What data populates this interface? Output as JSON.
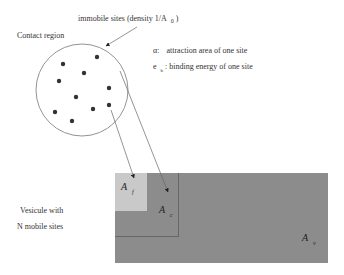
{
  "labels": {
    "immobile_sites": "immobile sites (density 1/A",
    "immobile_sites_sub": "0",
    "immobile_sites_close": ")",
    "contact_region": "Contact region",
    "alpha_symbol": "α:",
    "alpha_desc": "attraction   area of one site",
    "eb_symbol": "e",
    "eb_sub": "b",
    "eb_desc": ": binding energy of one site",
    "vesicle_line1": "Vesicule with",
    "vesicle_line2": "N mobile sites"
  },
  "areas": {
    "af": {
      "main": "A",
      "sub": "f"
    },
    "ac": {
      "main": "A",
      "sub": "c"
    },
    "av": {
      "main": "A",
      "sub": "v"
    }
  },
  "colors": {
    "vesicle_fill": "#8c8c8c",
    "free_area_fill": "#c9c9c9",
    "line": "#555555",
    "dot": "#333333"
  },
  "contact_region_dots": [
    [
      97,
      57
    ],
    [
      63,
      64
    ],
    [
      84,
      73
    ],
    [
      59,
      81
    ],
    [
      109,
      88
    ],
    [
      76,
      97
    ],
    [
      93,
      109
    ],
    [
      109,
      105
    ],
    [
      55,
      112
    ],
    [
      72,
      121
    ]
  ]
}
